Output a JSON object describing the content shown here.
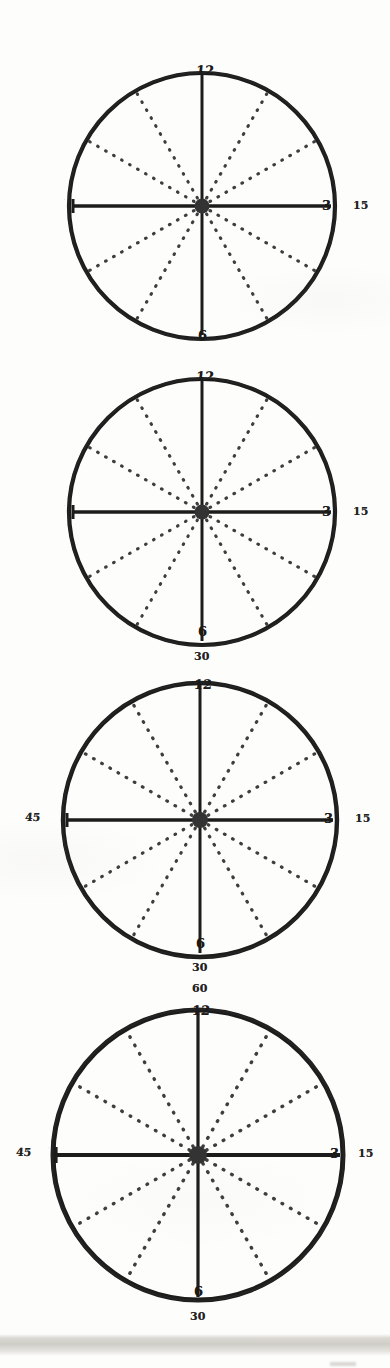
{
  "document": {
    "kind": "hand-drawn-clock-face-worksheet",
    "page_background": "#fdfdfc",
    "ink_color": "#1c1c1c",
    "dotted_color": "#4a4a4a",
    "clock_count": 4
  },
  "clocks": [
    {
      "id": "clock-1",
      "center_x": 202,
      "center_y": 206,
      "radius": 137,
      "hour_labels": {
        "twelve": "12",
        "three": "3",
        "six": "6",
        "nine": "9"
      },
      "minute_labels": {
        "fifteen": "15",
        "thirty": "",
        "forty_five": "",
        "sixty": ""
      },
      "hands": [
        "12",
        "3",
        "6",
        "9"
      ],
      "dotted_rays": 8
    },
    {
      "id": "clock-2",
      "center_x": 202,
      "center_y": 512,
      "radius": 137,
      "hour_labels": {
        "twelve": "12",
        "three": "3",
        "six": "6",
        "nine": "9"
      },
      "minute_labels": {
        "fifteen": "15",
        "thirty": "30",
        "forty_five": "",
        "sixty": ""
      },
      "hands": [
        "12",
        "3",
        "6",
        "9"
      ],
      "dotted_rays": 8
    },
    {
      "id": "clock-3",
      "center_x": 200,
      "center_y": 820,
      "radius": 141,
      "hour_labels": {
        "twelve": "12",
        "three": "3",
        "six": "6",
        "nine": "9"
      },
      "minute_labels": {
        "fifteen": "15",
        "thirty": "30",
        "forty_five": "45",
        "sixty": ""
      },
      "hands": [
        "12",
        "3",
        "6",
        "9"
      ],
      "dotted_rays": 8
    },
    {
      "id": "clock-4",
      "center_x": 198,
      "center_y": 1155,
      "radius": 150,
      "hour_labels": {
        "twelve": "12",
        "three": "3",
        "six": "6",
        "nine": "9"
      },
      "minute_labels": {
        "fifteen": "15",
        "thirty": "30",
        "forty_five": "45",
        "sixty": "60"
      },
      "hands": [
        "12",
        "3",
        "6",
        "9"
      ],
      "dotted_rays": 8
    }
  ]
}
